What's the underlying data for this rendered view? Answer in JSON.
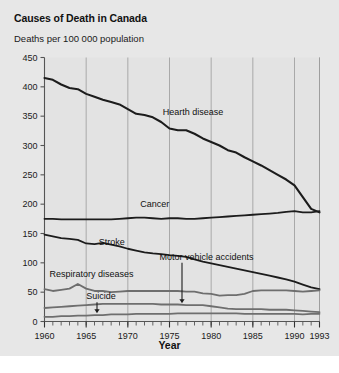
{
  "figure": {
    "title": "Causes of Death in Canada",
    "y_axis_header": "Deaths per 100 000 population",
    "x_axis_title": "Year",
    "background_color": "#e7e7e7",
    "plot_background_color": "#e3e3e3"
  },
  "chart_data": {
    "type": "line",
    "title": "Causes of Death in Canada",
    "xlabel": "Year",
    "ylabel": "Deaths per 100 000 population",
    "xlim": [
      1960,
      1993
    ],
    "ylim": [
      0,
      450
    ],
    "grid": "vertical-only",
    "legend": "inline-labels",
    "yticks": [
      0,
      50,
      100,
      150,
      200,
      250,
      300,
      350,
      400,
      450
    ],
    "xticks": [
      1960,
      1965,
      1970,
      1975,
      1980,
      1985,
      1990,
      1993
    ],
    "xtick_labels": [
      "1960",
      "1965",
      "1970",
      "1975",
      "1980",
      "1985",
      "1990",
      "1993"
    ],
    "x": [
      1960,
      1961,
      1962,
      1963,
      1964,
      1965,
      1966,
      1967,
      1968,
      1969,
      1970,
      1971,
      1972,
      1973,
      1974,
      1975,
      1976,
      1977,
      1978,
      1979,
      1980,
      1981,
      1982,
      1983,
      1984,
      1985,
      1986,
      1987,
      1988,
      1989,
      1990,
      1991,
      1992,
      1993
    ],
    "series": [
      {
        "name": "Hearth disease",
        "label": "Hearth disease",
        "color": "#1c1c1c",
        "width": 2.1,
        "label_x": 1974.2,
        "label_y": 352,
        "values": [
          415,
          412,
          404,
          398,
          396,
          388,
          383,
          378,
          374,
          370,
          362,
          354,
          352,
          348,
          340,
          329,
          326,
          326,
          320,
          312,
          306,
          300,
          292,
          288,
          280,
          273,
          266,
          258,
          250,
          242,
          232,
          212,
          192,
          186
        ]
      },
      {
        "name": "Cancer",
        "label": "Cancer",
        "color": "#1c1c1c",
        "width": 1.8,
        "label_x": 1971.5,
        "label_y": 196,
        "values": [
          175,
          175,
          174,
          174,
          174,
          174,
          174,
          174,
          174,
          175,
          176,
          177,
          177,
          176,
          175,
          176,
          176,
          175,
          175,
          176,
          177,
          178,
          179,
          180,
          181,
          182,
          183,
          184,
          185,
          187,
          188,
          186,
          186,
          188
        ]
      },
      {
        "name": "Stroke",
        "label": "Stroke",
        "color": "#1c1c1c",
        "width": 1.8,
        "label_x": 1966.5,
        "label_y": 130,
        "values": [
          148,
          145,
          142,
          141,
          139,
          133,
          132,
          134,
          131,
          128,
          124,
          121,
          118,
          116,
          115,
          113,
          112,
          110,
          106,
          102,
          99,
          96,
          93,
          90,
          87,
          84,
          81,
          78,
          75,
          72,
          68,
          63,
          58,
          55
        ]
      },
      {
        "name": "Respiratory diseases",
        "label": "Respiratory diseases",
        "color": "#6e6e6e",
        "width": 1.8,
        "label_x": 1960.6,
        "label_y": 76,
        "values": [
          55,
          52,
          54,
          56,
          64,
          56,
          52,
          52,
          50,
          51,
          52,
          52,
          52,
          52,
          52,
          52,
          52,
          51,
          51,
          48,
          47,
          44,
          45,
          45,
          47,
          52,
          53,
          53,
          53,
          53,
          52,
          51,
          52,
          53
        ]
      },
      {
        "name": "Motor vehicle accidents",
        "label": "Motor vehicle accidents",
        "color": "#6e6e6e",
        "width": 1.8,
        "label_x": 1973.8,
        "label_y": 104,
        "values": [
          23,
          24,
          25,
          26,
          27,
          28,
          29,
          30,
          30,
          30,
          30,
          30,
          30,
          30,
          29,
          29,
          29,
          28,
          28,
          28,
          26,
          24,
          22,
          21,
          21,
          21,
          21,
          20,
          20,
          20,
          19,
          18,
          17,
          16
        ]
      },
      {
        "name": "Suicide",
        "label": "Suicide",
        "color": "#6e6e6e",
        "width": 1.8,
        "label_x": 1965.0,
        "label_y": 38,
        "values": [
          8,
          8,
          9,
          9,
          10,
          10,
          11,
          11,
          12,
          12,
          12,
          13,
          13,
          13,
          13,
          13,
          14,
          14,
          14,
          14,
          14,
          14,
          14,
          14,
          13,
          13,
          13,
          13,
          13,
          13,
          13,
          12,
          13,
          13
        ]
      }
    ],
    "annotations": [
      {
        "text": "Suicide",
        "arrow_x": 1966.3,
        "arrow_from_y": 33,
        "arrow_to_y": 14
      },
      {
        "text": "Motor vehicle accidents",
        "arrow_x": 1976.5,
        "arrow_from_y": 100,
        "arrow_to_y": 31
      }
    ]
  }
}
